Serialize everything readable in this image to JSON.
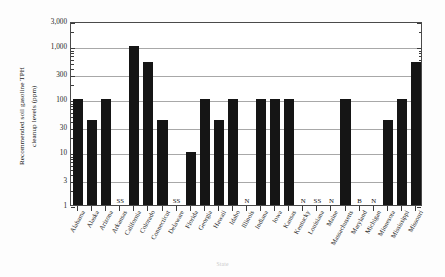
{
  "chart_data": {
    "type": "bar",
    "title": "",
    "xlabel": "State",
    "ylabel": "Recommended soil gasoline TPH cleanup levels (ppm)",
    "ylabel_line1": "Recommended soil gasoline TPH",
    "ylabel_line2": "cleanup levels (ppm)",
    "yscale": "log",
    "ylim": [
      1,
      3000
    ],
    "yticks": [
      1,
      3,
      10,
      30,
      100,
      300,
      1000,
      3000
    ],
    "ytick_labels": [
      "1",
      "3",
      "10",
      "30",
      "100",
      "300",
      "1,000",
      "3,000"
    ],
    "grid": true,
    "legend": "none",
    "categories": [
      "Alabama",
      "Alaska",
      "Arizona",
      "Arkansas",
      "California",
      "Colorado",
      "Connecticut",
      "Delaware",
      "Florida",
      "Georgia",
      "Hawaii",
      "Idaho",
      "Illinois",
      "Indiana",
      "Iowa",
      "Kansas",
      "Kentucky",
      "Louisiana",
      "Maine",
      "Massachusetts",
      "Maryland",
      "Michigan",
      "Minnesota",
      "Mississippi",
      "Missouri"
    ],
    "values": [
      100,
      40,
      100,
      null,
      1000,
      500,
      40,
      null,
      10,
      100,
      40,
      100,
      null,
      100,
      100,
      100,
      null,
      null,
      null,
      100,
      null,
      null,
      40,
      100,
      500
    ],
    "annotations": [
      {
        "category": "Arkansas",
        "text": "SS"
      },
      {
        "category": "Delaware",
        "text": "SS"
      },
      {
        "category": "Illinois",
        "text": "N"
      },
      {
        "category": "Kentucky",
        "text": "N"
      },
      {
        "category": "Louisiana",
        "text": "SS"
      },
      {
        "category": "Maine",
        "text": "N"
      },
      {
        "category": "Maryland",
        "text": "B"
      },
      {
        "category": "Michigan",
        "text": "N"
      }
    ],
    "bar_color": "#151515"
  }
}
